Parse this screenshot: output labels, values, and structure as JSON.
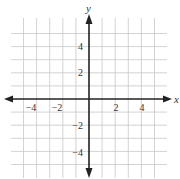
{
  "figure": {
    "type": "coordinate-grid",
    "x_axis": {
      "label": "x",
      "min": -6,
      "max": 6,
      "tick_labels": [
        "−4",
        "−2",
        "2",
        "4"
      ],
      "tick_values": [
        -4,
        -2,
        2,
        4
      ]
    },
    "y_axis": {
      "label": "y",
      "min": -6,
      "max": 6,
      "tick_labels": [
        "4",
        "2",
        "−2",
        "−4"
      ],
      "tick_values": [
        4,
        2,
        -2,
        -4
      ]
    },
    "grid": {
      "spacing": 1,
      "color": "#c8c8c8"
    },
    "axis_color": "#222222"
  }
}
